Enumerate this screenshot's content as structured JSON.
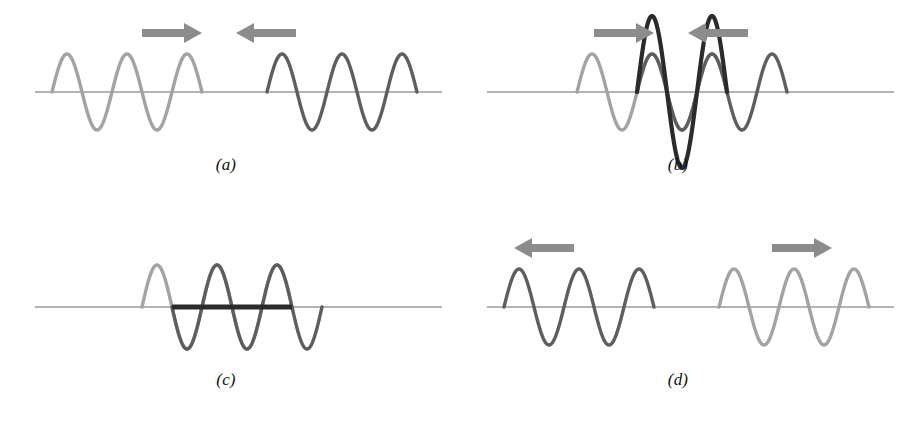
{
  "figure": {
    "background_color": "#ffffff",
    "width": 905,
    "height": 429
  },
  "colors": {
    "light_wave": "#a3a3a3",
    "dark_wave": "#5e5e5e",
    "resultant_wave": "#2b2b2b",
    "axis_line": "#6b6b6b",
    "arrow": "#8c8c8c",
    "label_text": "#111111"
  },
  "panels": [
    {
      "id": "a",
      "label": "(a)",
      "caption": "Two separate wave trains travelling toward each other",
      "axis": {
        "x_start": 35,
        "x_end": 442,
        "y": 92
      },
      "arrows": [
        {
          "name": "arrow-right",
          "direction": "right",
          "x": 142,
          "y": 33,
          "length": 60
        },
        {
          "name": "arrow-left",
          "direction": "left",
          "x": 236,
          "y": 33,
          "length": 60
        }
      ],
      "waves": [
        {
          "name": "light-wave-left",
          "color_key": "light_wave",
          "x_start": 52,
          "x_end": 202,
          "amplitude": 38,
          "wavelength": 60,
          "phase_deg": 0,
          "cycles": 2.5,
          "stroke_width": 3.4
        },
        {
          "name": "dark-wave-right",
          "color_key": "dark_wave",
          "x_start": 267,
          "x_end": 417,
          "amplitude": 38,
          "wavelength": 60,
          "phase_deg": 0,
          "cycles": 2.5,
          "stroke_width": 3.4
        }
      ],
      "resultant": null
    },
    {
      "id": "b",
      "label": "(b)",
      "caption": "Waves overlap in phase: constructive interference doubles the amplitude",
      "axis": {
        "x_start": 35,
        "x_end": 442,
        "y": 92
      },
      "arrows": [
        {
          "name": "arrow-right",
          "direction": "right",
          "x": 142,
          "y": 33,
          "length": 60
        },
        {
          "name": "arrow-left",
          "direction": "left",
          "x": 236,
          "y": 33,
          "length": 60
        }
      ],
      "waves": [
        {
          "name": "light-wave",
          "color_key": "light_wave",
          "x_start": 125,
          "x_end": 275,
          "amplitude": 38,
          "wavelength": 60,
          "phase_deg": 0,
          "cycles": 2.5,
          "stroke_width": 3.4
        },
        {
          "name": "dark-wave",
          "color_key": "dark_wave",
          "x_start": 185,
          "x_end": 335,
          "amplitude": 38,
          "wavelength": 60,
          "phase_deg": 0,
          "cycles": 2.5,
          "stroke_width": 3.4
        }
      ],
      "resultant": {
        "name": "resultant-wave-constructive",
        "color_key": "resultant_wave",
        "x_start": 185,
        "x_end": 275,
        "amplitude": 76,
        "wavelength": 60,
        "phase_deg": 0,
        "stroke_width": 4.2,
        "kind": "constructive"
      }
    },
    {
      "id": "c",
      "label": "(c)",
      "caption": "Waves overlap out of phase: destructive interference cancels the displacement",
      "axis": {
        "x_start": 35,
        "x_end": 442,
        "y": 92
      },
      "arrows": [],
      "waves": [
        {
          "name": "light-wave",
          "color_key": "light_wave",
          "x_start": 142,
          "x_end": 292,
          "amplitude": 42,
          "wavelength": 60,
          "phase_deg": 0,
          "cycles": 2.5,
          "stroke_width": 3.4
        },
        {
          "name": "dark-wave",
          "color_key": "dark_wave",
          "x_start": 172,
          "x_end": 322,
          "amplitude": 42,
          "wavelength": 60,
          "phase_deg": 180,
          "cycles": 2.5,
          "stroke_width": 3.4
        }
      ],
      "resultant": {
        "name": "resultant-flat-line",
        "color_key": "resultant_wave",
        "x_start": 172,
        "x_end": 292,
        "amplitude": 0,
        "stroke_width": 5,
        "kind": "destructive-flat"
      }
    },
    {
      "id": "d",
      "label": "(d)",
      "caption": "The two wave trains emerge unchanged and move apart",
      "axis": {
        "x_start": 35,
        "x_end": 442,
        "y": 92
      },
      "arrows": [
        {
          "name": "arrow-left",
          "direction": "left",
          "x": 62,
          "y": 33,
          "length": 60
        },
        {
          "name": "arrow-right",
          "direction": "right",
          "x": 320,
          "y": 33,
          "length": 60
        }
      ],
      "waves": [
        {
          "name": "dark-wave-left",
          "color_key": "dark_wave",
          "x_start": 52,
          "x_end": 202,
          "amplitude": 38,
          "wavelength": 60,
          "phase_deg": 0,
          "cycles": 2.5,
          "stroke_width": 3.4
        },
        {
          "name": "light-wave-right",
          "color_key": "light_wave",
          "x_start": 267,
          "x_end": 417,
          "amplitude": 38,
          "wavelength": 60,
          "phase_deg": 0,
          "cycles": 2.5,
          "stroke_width": 3.4
        }
      ],
      "resultant": null
    }
  ]
}
